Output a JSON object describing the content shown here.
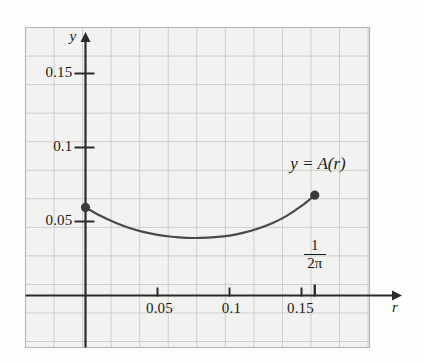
{
  "figure": {
    "kind": "math-graph",
    "background_color": "#f2f2f0",
    "frame_color": "#b9b9b9",
    "grid_color": "#c9c9c9",
    "grid_minor_color": "#dddddd",
    "axis_color": "#2b2b2b",
    "curve_color": "#4a4a4a",
    "point_color": "#3b3b3b"
  },
  "axes": {
    "x_axis_name": "r",
    "y_axis_name": "y",
    "x_ticks": [
      {
        "value": 0.05,
        "label": "0.05"
      },
      {
        "value": 0.1,
        "label": "0.1"
      },
      {
        "value": 0.15,
        "label": "0.15"
      }
    ],
    "y_ticks": [
      {
        "value": 0.05,
        "label": "0.05"
      },
      {
        "value": 0.1,
        "label": "0.1"
      },
      {
        "value": 0.15,
        "label": "0.15"
      }
    ],
    "special_x_tick": {
      "numerator": "1",
      "denominator": "2π",
      "value": 0.1592
    }
  },
  "annotations": {
    "curve_label": "y = A(r)"
  },
  "chart_data": {
    "type": "line",
    "title": "",
    "xlabel": "r",
    "ylabel": "y",
    "xlim": [
      -0.0205,
      0.1985
    ],
    "ylim": [
      -0.0358,
      0.1812
    ],
    "grid": true,
    "legend": "none",
    "series": [
      {
        "name": "y = A(r)",
        "x": [
          0.0,
          0.01,
          0.02,
          0.03,
          0.04,
          0.05,
          0.06,
          0.07,
          0.08,
          0.09,
          0.1,
          0.11,
          0.12,
          0.13,
          0.14,
          0.15,
          0.1592
        ],
        "values": [
          0.0595,
          0.054,
          0.0495,
          0.0458,
          0.043,
          0.041,
          0.0397,
          0.039,
          0.0389,
          0.0394,
          0.0405,
          0.0425,
          0.0453,
          0.049,
          0.054,
          0.0605,
          0.0678
        ]
      }
    ],
    "endpoints": [
      {
        "x": 0.0,
        "y": 0.0595,
        "marker": "filled-circle"
      },
      {
        "x": 0.1592,
        "y": 0.0678,
        "marker": "filled-circle"
      }
    ],
    "minimum": {
      "x": 0.0745,
      "y": 0.0389
    }
  }
}
